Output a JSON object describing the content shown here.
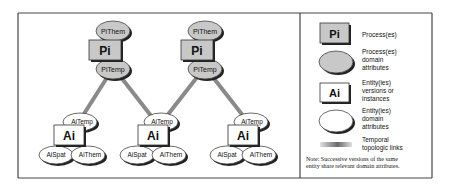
{
  "diagram": {
    "processes": [
      {
        "box": "Pi",
        "top_attr": "PiThem",
        "bottom_attr": "PiTemp",
        "cx": 113
      },
      {
        "box": "Pi",
        "top_attr": "PiThem",
        "bottom_attr": "PiTemp",
        "cx": 205
      }
    ],
    "entities": [
      {
        "box": "Ai",
        "temp_attr": "AiTemp",
        "spat_attr": "AiSpat",
        "them_attr": "AiThem",
        "cx": 75
      },
      {
        "box": "Ai",
        "temp_attr": "AiTemp",
        "spat_attr": "AiSpat",
        "them_attr": "AiThem",
        "cx": 160
      },
      {
        "box": "Ai",
        "temp_attr": "AiTemp",
        "spat_attr": "AiSpat",
        "them_attr": "AiThem",
        "cx": 250
      }
    ],
    "links": [
      {
        "from": "process-0",
        "to": "entity-0"
      },
      {
        "from": "process-0",
        "to": "entity-1"
      },
      {
        "from": "process-1",
        "to": "entity-1"
      },
      {
        "from": "process-1",
        "to": "entity-2"
      }
    ]
  },
  "legend": {
    "items": [
      {
        "symbol": "Pi",
        "label_lines": [
          "Process(es)"
        ]
      },
      {
        "symbol": "",
        "label_lines": [
          "Process(es)",
          "domain",
          "attributes"
        ]
      },
      {
        "symbol": "Ai",
        "label_lines": [
          "Entity(ies)",
          "versions or",
          "instances"
        ]
      },
      {
        "symbol": "",
        "label_lines": [
          "Entity(ies)",
          "domain",
          "attributes"
        ]
      },
      {
        "symbol": "",
        "label_lines": [
          "Temporal",
          "topologic links"
        ]
      }
    ],
    "note_lines": [
      "Note: Successive versions of the same",
      "entity share relevant domain attributes."
    ]
  },
  "colors": {
    "process_fill": "#c8c8c8",
    "entity_fill": "#ffffff",
    "stroke": "#333333",
    "shadow": "#222222",
    "link": "#8a8a8a"
  }
}
